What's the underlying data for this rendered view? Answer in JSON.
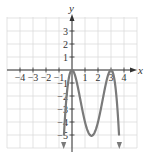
{
  "chart_data": {
    "type": "line",
    "title": "",
    "xlabel": "x",
    "ylabel": "y",
    "xlim": [
      -5,
      5
    ],
    "ylim": [
      -6,
      4
    ],
    "grid": true,
    "x_ticks": [
      -4,
      -3,
      -2,
      -1,
      1,
      2,
      3,
      4
    ],
    "y_ticks": [
      3,
      2,
      1,
      -1,
      -2,
      -3,
      -4,
      -5
    ],
    "x_tick_labels": [
      "−4",
      "−3",
      "−2",
      "−1",
      "1",
      "2",
      "3",
      "4"
    ],
    "y_tick_labels": [
      "3",
      "2",
      "1",
      "−1",
      "−2",
      "−3",
      "−4",
      "−5"
    ],
    "series": [
      {
        "name": "curve",
        "description": "polynomial with local maxima at (0,0) and (3,0), local minimum near (1.5,-5.06), both ends pointing downward (arrows)",
        "x": [
          -0.6,
          -0.5,
          -0.25,
          0,
          0.25,
          0.5,
          0.75,
          1,
          1.25,
          1.5,
          1.75,
          2,
          2.25,
          2.5,
          2.75,
          3,
          3.25,
          3.5,
          3.6
        ],
        "y": [
          -4.7,
          -3.06,
          -0.66,
          0,
          -0.47,
          -1.56,
          -2.85,
          -4.0,
          -4.73,
          -5.06,
          -4.73,
          -4.0,
          -2.85,
          -1.56,
          -0.47,
          0,
          -0.66,
          -3.06,
          -4.7
        ],
        "end_arrows": true,
        "color": "#7a7a7a"
      }
    ],
    "colors": {
      "grid": "#dcdcdc",
      "axis": "#333333",
      "curve": "#7a7a7a"
    }
  }
}
